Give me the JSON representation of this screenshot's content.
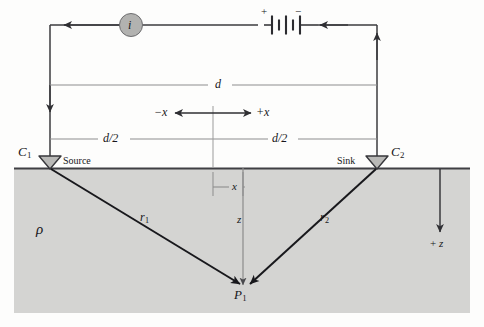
{
  "figure": {
    "type": "physics-schematic-diagram",
    "width": 484,
    "height": 327
  },
  "colors": {
    "background": "#fdfdfc",
    "subsurface_fill": "#d4d4d2",
    "circuit_line": "#3b3b3f",
    "dimension_line": "#8d8d8d",
    "ray_line": "#1b1b1f",
    "electrode_fill": "#b9b9b7",
    "source_circle_fill": "#b2b2b0",
    "text": "#17171a"
  },
  "circuit": {
    "current_source_label": "i",
    "current_source_icon": "current-source-circle-icon",
    "battery_icon": "battery-cell-icon",
    "battery_positive_label": "+",
    "battery_negative_label": "−",
    "arrow_left_icon": "arrow-left-icon",
    "arrow_down_icon": "arrow-down-icon",
    "arrow_up_icon": "arrow-up-icon"
  },
  "electrodes": [
    {
      "id": "C1",
      "name_label": "C",
      "name_sub": "1",
      "role_label": "Source",
      "icon": "electrode-triangle-icon",
      "x": 50,
      "y": 168
    },
    {
      "id": "C2",
      "name_label": "C",
      "name_sub": "2",
      "role_label": "Sink",
      "icon": "electrode-triangle-icon",
      "x": 376,
      "y": 168
    }
  ],
  "dimensions": [
    {
      "id": "d",
      "label": "d",
      "description": "full electrode separation",
      "y": 85
    },
    {
      "id": "d-over-2-left",
      "label": "d/2",
      "description": "left half separation",
      "y": 139
    },
    {
      "id": "d-over-2-right",
      "label": "d/2",
      "description": "right half separation",
      "y": 139
    },
    {
      "id": "x-offset",
      "label": "x",
      "description": "horizontal offset of P1 from midpoint",
      "y": 187
    }
  ],
  "axes": {
    "negative_x_label": "−x",
    "positive_x_label": "+x",
    "z_label": "z",
    "positive_z_label": "+ z",
    "x_axis_icon": "double-headed-arrow-icon",
    "z_axis_icon": "arrow-down-icon"
  },
  "subsurface": {
    "resistivity_symbol": "ρ",
    "resistivity_name": "resistivity-rho-label"
  },
  "rays": [
    {
      "id": "r1",
      "label": "r",
      "sub": "1",
      "from": "C1",
      "to": "P1"
    },
    {
      "id": "r2",
      "label": "r",
      "sub": "2",
      "from": "C2",
      "to": "P1"
    }
  ],
  "points": [
    {
      "id": "P1",
      "label": "P",
      "sub": "1",
      "description": "measurement point in subsurface"
    }
  ]
}
